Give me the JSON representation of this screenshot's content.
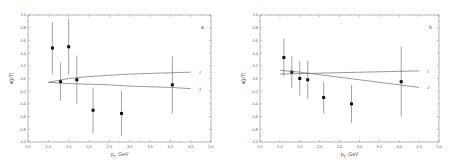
{
  "chart_data": [
    {
      "type": "scatter",
      "panel_label": "a",
      "xlabel": "p_T, GeV",
      "ylabel": "a(p_T)",
      "xlim": [
        0.5,
        5.0
      ],
      "ylim": [
        -1.0,
        1.0
      ],
      "x_ticks": [
        "0.5",
        "1.0",
        "1.5",
        "2.0",
        "2.5",
        "3.0",
        "3.5",
        "4.0",
        "4.5",
        "5.0"
      ],
      "y_ticks": [
        "-1.0",
        "-0.8",
        "-0.6",
        "-0.4",
        "-0.2",
        "0.0",
        "0.2",
        "0.4",
        "0.6",
        "0.8",
        "1.0"
      ],
      "grid": false,
      "series": [
        {
          "name": "data",
          "marker": "square",
          "x": [
            1.1,
            1.3,
            1.5,
            1.7,
            2.1,
            2.8,
            4.05
          ],
          "y": [
            0.48,
            -0.05,
            0.5,
            -0.02,
            -0.5,
            -0.55,
            -0.1
          ],
          "yerr": [
            0.41,
            0.3,
            0.44,
            0.38,
            0.36,
            0.36,
            0.45
          ]
        },
        {
          "name": "1",
          "type": "line",
          "x": [
            1.0,
            1.5,
            2.0,
            2.5,
            3.0,
            3.5,
            4.0,
            4.5
          ],
          "y": [
            -0.06,
            0.0,
            0.03,
            0.05,
            0.07,
            0.08,
            0.09,
            0.1
          ]
        },
        {
          "name": "3",
          "type": "line",
          "x": [
            1.0,
            1.5,
            2.0,
            2.5,
            3.0,
            3.5,
            4.0,
            4.5
          ],
          "y": [
            -0.06,
            -0.08,
            -0.09,
            -0.1,
            -0.12,
            -0.13,
            -0.14,
            -0.16
          ]
        }
      ]
    },
    {
      "type": "scatter",
      "panel_label": "b",
      "xlabel": "p_T, GeV",
      "ylabel": "a(p_T)",
      "xlim": [
        0.5,
        5.0
      ],
      "ylim": [
        -1.0,
        1.0
      ],
      "x_ticks": [
        "0.5",
        "1.0",
        "1.5",
        "2.0",
        "2.5",
        "3.0",
        "3.5",
        "4.0",
        "4.5",
        "5.0"
      ],
      "y_ticks": [
        "-1.0",
        "-0.8",
        "-0.6",
        "-0.4",
        "-0.2",
        "0.0",
        "0.2",
        "0.4",
        "0.6",
        "0.8",
        "1.0"
      ],
      "grid": false,
      "series": [
        {
          "name": "data",
          "marker": "square",
          "x": [
            1.1,
            1.3,
            1.5,
            1.7,
            2.1,
            2.8,
            4.05
          ],
          "y": [
            0.33,
            0.1,
            0.0,
            -0.02,
            -0.3,
            -0.4,
            -0.05
          ],
          "yerr": [
            0.3,
            0.25,
            0.27,
            0.3,
            0.25,
            0.3,
            0.55
          ]
        },
        {
          "name": "1",
          "type": "line",
          "x": [
            1.0,
            4.5
          ],
          "y": [
            0.07,
            0.12
          ]
        },
        {
          "name": "2",
          "type": "line",
          "x": [
            1.0,
            1.5,
            2.0,
            2.5,
            3.0,
            3.5,
            4.0,
            4.5
          ],
          "y": [
            0.13,
            0.1,
            0.06,
            0.02,
            -0.02,
            -0.06,
            -0.1,
            -0.14
          ]
        }
      ]
    }
  ]
}
